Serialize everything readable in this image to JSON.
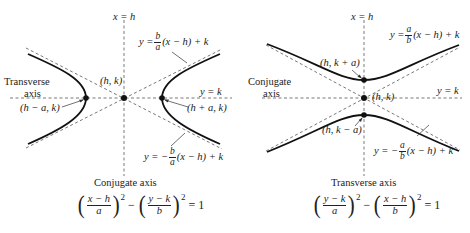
{
  "figure": {
    "left_diagram": {
      "orientation": "horizontal transverse axis",
      "labels": {
        "vertical_axis": "x = h",
        "horizontal_axis": "y = k",
        "center": "(h, k)",
        "left_vertex": "(h − a, k)",
        "right_vertex": "(h + a, k)",
        "transverse_axis_line1": "Transverse",
        "transverse_axis_line2": "axis",
        "conjugate_axis": "Conjugate axis",
        "asymptote_upper_prefix": "y =",
        "asymptote_upper_num": "b",
        "asymptote_upper_den": "a",
        "asymptote_upper_suffix": "(x − h) + k",
        "asymptote_lower_prefix": "y = −",
        "asymptote_lower_num": "b",
        "asymptote_lower_den": "a",
        "asymptote_lower_suffix": "(x − h) + k"
      },
      "equation": {
        "frac1_num": "x − h",
        "frac1_den": "a",
        "frac2_num": "y − k",
        "frac2_den": "b",
        "exponent": "2",
        "minus": "−",
        "rhs": "= 1"
      }
    },
    "right_diagram": {
      "orientation": "vertical transverse axis",
      "labels": {
        "vertical_axis": "x = h",
        "horizontal_axis": "y = k",
        "center": "(h, k)",
        "top_vertex": "(h, k + a)",
        "bottom_vertex": "(h, k − a)",
        "conjugate_axis_line1": "Conjugate",
        "conjugate_axis_line2": "axis",
        "transverse_axis": "Transverse axis",
        "asymptote_upper_prefix": "y =",
        "asymptote_upper_num": "a",
        "asymptote_upper_den": "b",
        "asymptote_upper_suffix": "(x − h) + k",
        "asymptote_lower_prefix": "y = −",
        "asymptote_lower_num": "a",
        "asymptote_lower_den": "b",
        "asymptote_lower_suffix": "(x − h) + k"
      },
      "equation": {
        "frac1_num": "y − k",
        "frac1_den": "a",
        "frac2_num": "x − h",
        "frac2_den": "b",
        "exponent": "2",
        "minus": "−",
        "rhs": "= 1"
      }
    },
    "colors": {
      "curve": "#111111",
      "dashed": "#555555",
      "text": "#222222"
    }
  }
}
